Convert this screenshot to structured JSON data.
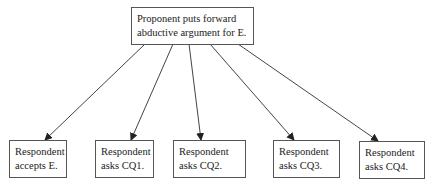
{
  "diagram": {
    "root": {
      "lines": [
        "Proponent puts forward",
        "abductive argument for E."
      ]
    },
    "children": [
      {
        "lines": [
          "Respondent",
          "accepts E."
        ]
      },
      {
        "lines": [
          "Respondent",
          "asks CQ1."
        ]
      },
      {
        "lines": [
          "Respondent",
          "asks CQ2."
        ]
      },
      {
        "lines": [
          "Respondent",
          "asks CQ3."
        ]
      },
      {
        "lines": [
          "Respondent",
          "asks CQ4."
        ]
      }
    ],
    "edges": [
      {
        "from": "root",
        "to": 0
      },
      {
        "from": "root",
        "to": 1
      },
      {
        "from": "root",
        "to": 2
      },
      {
        "from": "root",
        "to": 3
      },
      {
        "from": "root",
        "to": 4
      }
    ]
  }
}
